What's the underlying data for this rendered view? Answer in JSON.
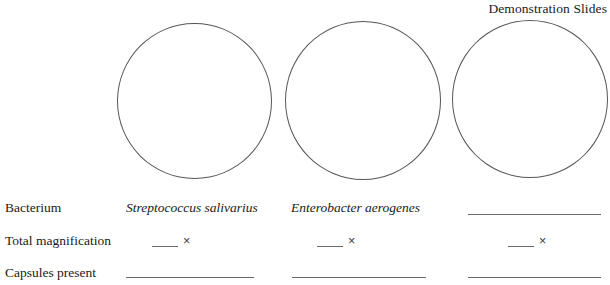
{
  "page": {
    "heading": "Demonstration Slides",
    "clipped_top_text": "",
    "background_color": "#ffffff",
    "text_color": "#1a1a1a",
    "rule_color": "#6a6a6e",
    "circle_stroke_color": "#55565a"
  },
  "drawing_circles": [
    {
      "name": "field-of-view-1",
      "label": ""
    },
    {
      "name": "field-of-view-2",
      "label": ""
    },
    {
      "name": "field-of-view-3",
      "label": ""
    }
  ],
  "table": {
    "row_labels": [
      "Bacterium",
      "Total magnification",
      "Capsules present"
    ],
    "columns": [
      {
        "bacterium": "Streptococcus salivarius",
        "bacterium_is_blank": false,
        "total_magnification": "",
        "magnification_unit": "×",
        "capsules_present": ""
      },
      {
        "bacterium": "Enterobacter aerogenes",
        "bacterium_is_blank": false,
        "total_magnification": "",
        "magnification_unit": "×",
        "capsules_present": ""
      },
      {
        "bacterium": "",
        "bacterium_is_blank": true,
        "total_magnification": "",
        "magnification_unit": "×",
        "capsules_present": ""
      }
    ]
  }
}
